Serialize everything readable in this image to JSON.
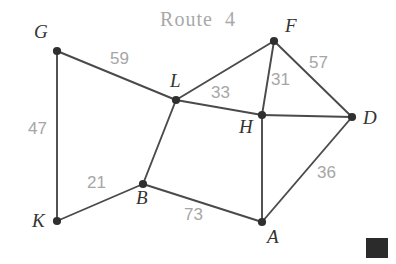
{
  "title": "Route  4",
  "colors": {
    "background": "#ffffff",
    "edge": "#4a4a4a",
    "node": "#2f2f2f",
    "node_label": "#333333",
    "edge_label": "#a6a6a6",
    "title": "#a9a9a9",
    "corner_mark": "#2b2b2b"
  },
  "graph": {
    "type": "weighted-undirected-graph",
    "nodes": [
      {
        "id": "G",
        "label": "G",
        "x": 57,
        "y": 51,
        "label_x": 34,
        "label_y": 22
      },
      {
        "id": "L",
        "label": "L",
        "x": 176,
        "y": 100,
        "label_x": 170,
        "label_y": 71
      },
      {
        "id": "F",
        "label": "F",
        "x": 274,
        "y": 41,
        "label_x": 285,
        "label_y": 16
      },
      {
        "id": "D",
        "label": "D",
        "x": 352,
        "y": 117,
        "label_x": 363,
        "label_y": 108
      },
      {
        "id": "H",
        "label": "H",
        "x": 262,
        "y": 115,
        "label_x": 239,
        "label_y": 117
      },
      {
        "id": "K",
        "label": "K",
        "x": 57,
        "y": 221,
        "label_x": 32,
        "label_y": 211
      },
      {
        "id": "B",
        "label": "B",
        "x": 143,
        "y": 184,
        "label_x": 136,
        "label_y": 188
      },
      {
        "id": "A",
        "label": "A",
        "x": 262,
        "y": 222,
        "label_x": 267,
        "label_y": 227
      }
    ],
    "edges": [
      {
        "from": "G",
        "to": "L",
        "weight": "59",
        "label_x": 110,
        "label_y": 50
      },
      {
        "from": "G",
        "to": "K",
        "weight": "47",
        "label_x": 28,
        "label_y": 120
      },
      {
        "from": "K",
        "to": "B",
        "weight": "21",
        "label_x": 87,
        "label_y": 174
      },
      {
        "from": "B",
        "to": "L",
        "weight": "",
        "label_x": 0,
        "label_y": 0
      },
      {
        "from": "B",
        "to": "A",
        "weight": "73",
        "label_x": 184,
        "label_y": 206
      },
      {
        "from": "L",
        "to": "H",
        "weight": "33",
        "label_x": 211,
        "label_y": 84
      },
      {
        "from": "L",
        "to": "F",
        "weight": "",
        "label_x": 0,
        "label_y": 0
      },
      {
        "from": "F",
        "to": "H",
        "weight": "31",
        "label_x": 271,
        "label_y": 71
      },
      {
        "from": "F",
        "to": "D",
        "weight": "57",
        "label_x": 309,
        "label_y": 54
      },
      {
        "from": "H",
        "to": "D",
        "weight": "",
        "label_x": 0,
        "label_y": 0
      },
      {
        "from": "H",
        "to": "A",
        "weight": "",
        "label_x": 0,
        "label_y": 0
      },
      {
        "from": "A",
        "to": "D",
        "weight": "36",
        "label_x": 317,
        "label_y": 164
      }
    ]
  },
  "corner_mark": {
    "x": 366,
    "y": 238,
    "width": 22,
    "height": 20
  }
}
